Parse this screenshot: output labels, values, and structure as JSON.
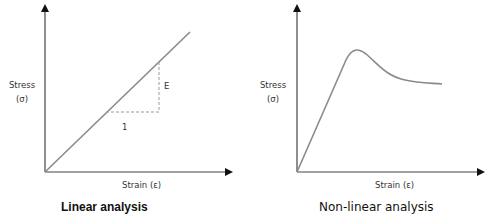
{
  "panels": [
    {
      "title": "Linear analysis",
      "y_label": "Stress",
      "y_symbol": "(σ)",
      "x_label": "Strain (ε)",
      "slope_label": "E",
      "run_label": "1"
    },
    {
      "title": "Non-linear analysis",
      "y_label": "Stress",
      "y_symbol": "(σ)",
      "x_label": "Strain (ε)"
    }
  ],
  "colors": {
    "curve": "#8a8a8a",
    "axis": "#333333",
    "dashed": "#9a9a9a"
  }
}
